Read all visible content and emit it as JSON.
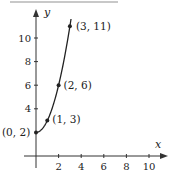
{
  "chart_data": {
    "type": "line",
    "title": "",
    "xlabel": "x",
    "ylabel": "y",
    "xlim": [
      0,
      10
    ],
    "ylim": [
      0,
      11
    ],
    "x_ticks": [
      2,
      4,
      6,
      8,
      10
    ],
    "y_ticks": [
      4,
      6,
      8,
      10
    ],
    "grid": false,
    "series": [
      {
        "name": "curve",
        "x": [
          0,
          1,
          2,
          3
        ],
        "y": [
          2,
          3,
          6,
          11
        ]
      }
    ],
    "points": [
      {
        "x": 0,
        "y": 2,
        "label": "(0, 2)"
      },
      {
        "x": 1,
        "y": 3,
        "label": "(1, 3)"
      },
      {
        "x": 2,
        "y": 6,
        "label": "(2, 6)"
      },
      {
        "x": 3,
        "y": 11,
        "label": "(3, 11)"
      }
    ],
    "colors": {
      "line": "#222222",
      "axis": "#333333",
      "top_rule": "#bfbfbf"
    }
  }
}
